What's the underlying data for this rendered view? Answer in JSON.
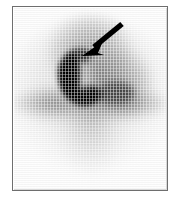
{
  "image": {
    "modality_label": "scintigraphic-scan",
    "background_color": "#ffffff",
    "frame_border_color": "#6e6e6e",
    "field_color": "#fdfdfd",
    "alt_text": "Grayscale planar nuclear medicine scan showing a dark crescent-shaped focus of increased uptake in the left upper field, indicated by a black arrow."
  },
  "frame": {
    "left": 12,
    "top": 6,
    "width": 156,
    "height": 185
  },
  "annotation": {
    "arrow": {
      "name": "pointer-arrow",
      "color": "#000000",
      "tail_x": 108,
      "tail_y": 16,
      "tip_x": 70,
      "tip_y": 47,
      "direction": "down-left"
    }
  },
  "features": [
    {
      "name": "crescent-focus",
      "description": "dark crescent of intense uptake",
      "intensity": "very-high",
      "color": "#080808"
    },
    {
      "name": "superior-blob",
      "description": "diffuse superior uptake",
      "intensity": "moderate",
      "color": "#5f5f5f"
    },
    {
      "name": "right-lobe",
      "description": "right-sided moderate uptake lobe",
      "intensity": "moderate",
      "color": "#505050"
    },
    {
      "name": "horizontal-band",
      "description": "transverse band of activity",
      "intensity": "moderate-high",
      "color": "#464646"
    },
    {
      "name": "inferior-plume",
      "description": "faint inferior tapering activity",
      "intensity": "low",
      "color": "#828282"
    }
  ]
}
